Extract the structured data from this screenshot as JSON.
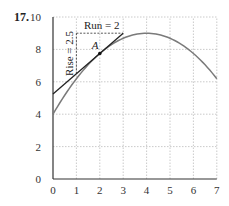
{
  "problem_number": "17.",
  "chart_data": {
    "type": "line",
    "title": "",
    "xlabel": "",
    "ylabel": "",
    "xlim": [
      0,
      7
    ],
    "ylim": [
      0,
      10
    ],
    "x_ticks": [
      "0",
      "1",
      "2",
      "3",
      "4",
      "5",
      "6",
      "7"
    ],
    "y_ticks": [
      "0",
      "2",
      "4",
      "6",
      "8",
      "10"
    ],
    "grid": true,
    "series": [
      {
        "name": "curve",
        "x": [
          0,
          1,
          2,
          3,
          4,
          5,
          6,
          7
        ],
        "y": [
          4,
          6.19,
          7.75,
          8.69,
          9,
          8.69,
          7.75,
          6.19
        ]
      },
      {
        "name": "tangent line at A",
        "x": [
          0,
          3
        ],
        "y": [
          5.25,
          9.0
        ]
      }
    ],
    "point": {
      "label": "A",
      "x": 2,
      "y": 7.75
    },
    "annotations": [
      {
        "text": "Run = 2",
        "from": [
          1,
          9
        ],
        "to": [
          3,
          9
        ]
      },
      {
        "text": "Rise = 2.5",
        "from": [
          1,
          6.5
        ],
        "to": [
          1,
          9
        ]
      }
    ]
  },
  "labels": {
    "run": "Run = 2",
    "rise": "Rise = 2.5",
    "point": "A"
  },
  "colors": {
    "curve": "#7a7a7a",
    "tangent": "#222222",
    "grid": "#bdbdbd",
    "axis": "#333333"
  }
}
